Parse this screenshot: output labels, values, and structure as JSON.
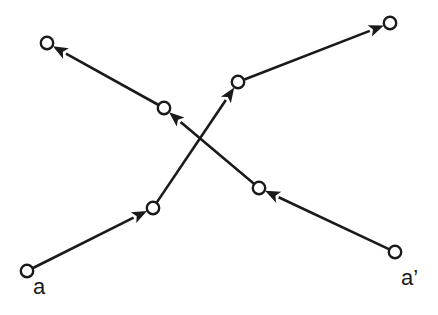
{
  "figure": {
    "background_color": "#ffffff",
    "stroke_color": "#1a1a1a",
    "node_fill_color": "#ffffff",
    "width": 438,
    "height": 315,
    "labels": [
      {
        "id": "a",
        "text": "a",
        "x": 33,
        "y": 276
      },
      {
        "id": "a-prime",
        "text": "a’",
        "x": 401,
        "y": 267
      }
    ]
  },
  "chart_data": {
    "type": "scatter",
    "xlabel": "",
    "ylabel": "",
    "xlim": [
      0,
      438
    ],
    "ylim": [
      315,
      0
    ],
    "grid": false,
    "legend": "none",
    "node_radius": 6.2,
    "annotations": [
      "a",
      "a’"
    ],
    "series": [
      {
        "name": "a",
        "start_label": "a",
        "direction": "forward",
        "points": [
          {
            "x": 27,
            "y": 271
          },
          {
            "x": 153,
            "y": 208
          },
          {
            "x": 238,
            "y": 82
          },
          {
            "x": 390,
            "y": 23
          }
        ]
      },
      {
        "name": "a’",
        "start_label": "a’",
        "direction": "forward",
        "points": [
          {
            "x": 395,
            "y": 252
          },
          {
            "x": 259,
            "y": 188
          },
          {
            "x": 164,
            "y": 108
          },
          {
            "x": 47,
            "y": 43
          }
        ]
      }
    ],
    "crossing_point": {
      "x": 200,
      "y": 142
    }
  }
}
